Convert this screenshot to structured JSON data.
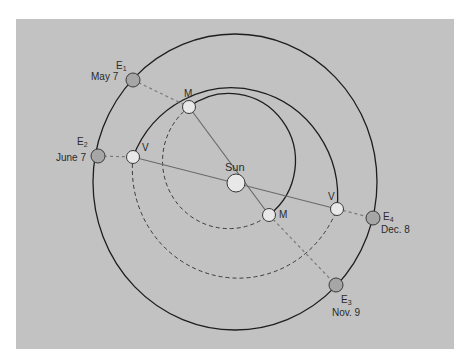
{
  "diagram": {
    "background_color": "#c2c2c2",
    "frame": {
      "x": 16,
      "y": 19,
      "width": 438,
      "height": 330
    },
    "sun": {
      "label": "Sun",
      "x": 236,
      "y": 183,
      "r": 9
    },
    "orbits": [
      {
        "name": "earth-orbit",
        "cx": 235,
        "cy": 182,
        "rx": 142,
        "ry": 148
      },
      {
        "name": "venus-orbit",
        "cx": 234,
        "cy": 182,
        "rx": 106,
        "ry": 109
      },
      {
        "name": "mercury-orbit",
        "cx": 225,
        "cy": 180,
        "rx": 57,
        "ry": 58
      }
    ],
    "earth_positions": [
      {
        "id": "E1",
        "letter": "E",
        "sub": "1",
        "date": "May 7",
        "x": 133,
        "y": 80
      },
      {
        "id": "E2",
        "letter": "E",
        "sub": "2",
        "date": "June 7",
        "x": 98,
        "y": 156
      },
      {
        "id": "E3",
        "letter": "E",
        "sub": "3",
        "date": "Nov. 9",
        "x": 336,
        "y": 285
      },
      {
        "id": "E4",
        "letter": "E",
        "sub": "4",
        "date": "Dec. 8",
        "x": 373,
        "y": 218
      }
    ],
    "mercury_positions": [
      {
        "label": "M",
        "x": 189,
        "y": 107
      },
      {
        "label": "M",
        "x": 269,
        "y": 215
      }
    ],
    "venus_positions": [
      {
        "label": "V",
        "x": 133,
        "y": 157
      },
      {
        "label": "V",
        "x": 337,
        "y": 209
      }
    ],
    "colors": {
      "orbit_stroke": "#1e1e1e",
      "line_solid": "#6a6a6a",
      "line_dashed": "#7a7a7a",
      "earth_fill": "#a6a6a6",
      "planet_fill": "#e8e8e8",
      "body_stroke": "#3a3a3a"
    }
  }
}
